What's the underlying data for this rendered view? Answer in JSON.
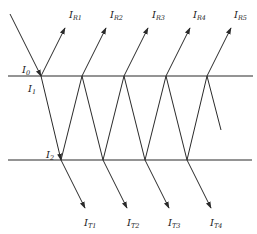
{
  "diagram": {
    "type": "multiple-reflection-transmission",
    "surfaces": [
      {
        "name": "top-surface",
        "y": 76,
        "x1": 8,
        "x2": 253
      },
      {
        "name": "bottom-surface",
        "y": 160,
        "x1": 8,
        "x2": 252
      }
    ],
    "labels": {
      "incident": {
        "main": "I",
        "sub": "0"
      },
      "i1": {
        "main": "I",
        "sub": "1"
      },
      "i2": {
        "main": "I",
        "sub": "2"
      },
      "reflected": [
        {
          "main": "I",
          "sub": "R1"
        },
        {
          "main": "I",
          "sub": "R2"
        },
        {
          "main": "I",
          "sub": "R3"
        },
        {
          "main": "I",
          "sub": "R4"
        },
        {
          "main": "I",
          "sub": "R5"
        }
      ],
      "transmitted": [
        {
          "main": "I",
          "sub": "T1"
        },
        {
          "main": "I",
          "sub": "T2"
        },
        {
          "main": "I",
          "sub": "T3"
        },
        {
          "main": "I",
          "sub": "T4"
        }
      ]
    },
    "colors": {
      "line": "#2a2a2a",
      "background": "#ffffff"
    }
  }
}
